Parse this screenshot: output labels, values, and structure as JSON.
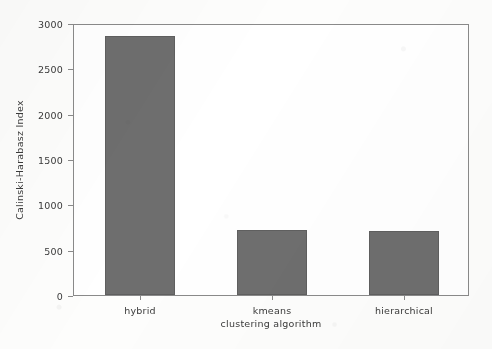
{
  "chart_data": {
    "type": "bar",
    "title": "",
    "xlabel": "clustering algorithm",
    "ylabel": "Calinski-Harabasz Index",
    "categories": [
      "hybrid",
      "kmeans",
      "hierarchical"
    ],
    "values": [
      2857,
      714,
      705
    ],
    "ylim": [
      0,
      3000
    ],
    "yticks": [
      0,
      500,
      1000,
      1500,
      2000,
      2500,
      3000
    ],
    "ytick_labels": [
      "0",
      "500",
      "1000",
      "1500",
      "2000",
      "2500",
      "3000"
    ],
    "grid": false,
    "legend": null,
    "bar_color": "#6e6e6e",
    "plot_background": "#ffffff",
    "axis_color": "#8a8a8a",
    "text_color": "#3a3a3a"
  }
}
